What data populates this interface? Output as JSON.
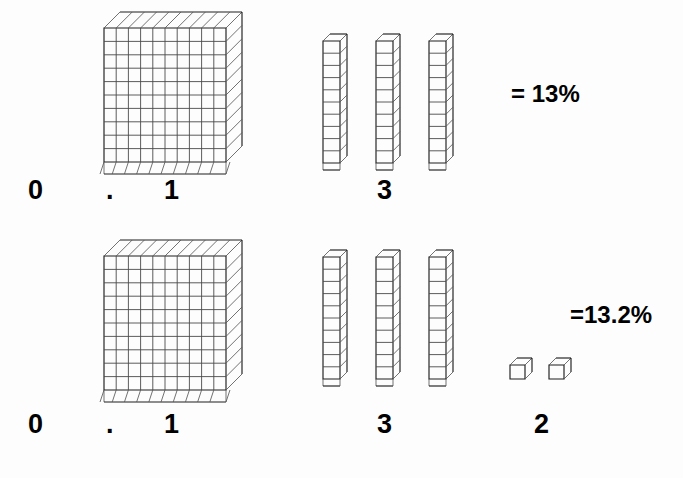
{
  "figure": {
    "background_color": "#fdfdfd",
    "ink_color": "#1f1f1f"
  },
  "rows": [
    {
      "id": "row-1",
      "value_text": "0.13",
      "result_label": "= 13%",
      "digits": [
        {
          "char": "0",
          "place": "ones",
          "x": 28,
          "y": 177
        },
        {
          "char": ".",
          "place": "decimal-point",
          "x": 106,
          "y": 177
        },
        {
          "char": "1",
          "place": "tenths",
          "x": 164,
          "y": 177
        },
        {
          "char": "3",
          "place": "hundredths",
          "x": 377,
          "y": 177
        }
      ],
      "blocks": {
        "flats": {
          "count": 1,
          "grid_rows": 10,
          "grid_cols": 10,
          "represents": "0.1"
        },
        "rods": {
          "count": 3,
          "segments": 10,
          "represents": "0.03"
        },
        "units": {
          "count": 0,
          "represents": "0"
        }
      }
    },
    {
      "id": "row-2",
      "value_text": "0.132",
      "result_label": "=13.2%",
      "digits": [
        {
          "char": "0",
          "place": "ones",
          "x": 28,
          "y": 411
        },
        {
          "char": ".",
          "place": "decimal-point",
          "x": 106,
          "y": 411
        },
        {
          "char": "1",
          "place": "tenths",
          "x": 164,
          "y": 411
        },
        {
          "char": "3",
          "place": "hundredths",
          "x": 377,
          "y": 411
        },
        {
          "char": "2",
          "place": "thousandths",
          "x": 534,
          "y": 411
        }
      ],
      "blocks": {
        "flats": {
          "count": 1,
          "grid_rows": 10,
          "grid_cols": 10,
          "represents": "0.1"
        },
        "rods": {
          "count": 3,
          "segments": 10,
          "represents": "0.03"
        },
        "units": {
          "count": 2,
          "represents": "0.002"
        }
      }
    }
  ],
  "labels": {
    "row1_result": "= 13%",
    "row2_result": "=13.2%"
  }
}
